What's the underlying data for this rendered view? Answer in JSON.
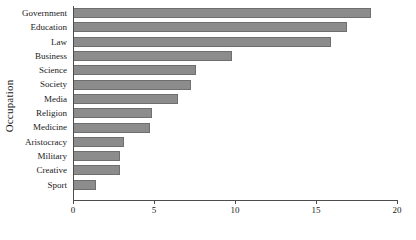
{
  "chart_data": {
    "type": "bar",
    "orientation": "horizontal",
    "title": "",
    "xlabel": "",
    "ylabel": "Occupation",
    "xlim": [
      0,
      20
    ],
    "xticks": [
      0,
      5,
      10,
      15,
      20
    ],
    "grid": false,
    "legend": null,
    "bar_color": "#8c8c8c",
    "bar_edge_color": "#6f6f6f",
    "categories": [
      "Government",
      "Education",
      "Law",
      "Business",
      "Science",
      "Society",
      "Media",
      "Religion",
      "Medicine",
      "Aristocracy",
      "Military",
      "Creative",
      "Sport"
    ],
    "values": [
      18.4,
      16.9,
      15.9,
      9.8,
      7.6,
      7.3,
      6.5,
      4.9,
      4.75,
      3.15,
      2.9,
      2.9,
      1.4
    ]
  }
}
